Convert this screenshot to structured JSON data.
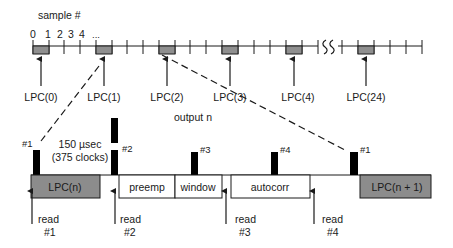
{
  "diagram": {
    "colors": {
      "line": "#1a1a1a",
      "gray_block": "#8c8c8c",
      "sample_block": "#8f8f8f",
      "bar": "#000000",
      "background": "#ffffff"
    },
    "sample_axis": {
      "label": "sample #",
      "tick_numbers": [
        "0",
        "1",
        "2",
        "3",
        "4",
        "..."
      ],
      "break_glyph": "SS"
    },
    "lpc_frames": [
      {
        "label": "LPC(0)"
      },
      {
        "label": "LPC(1)"
      },
      {
        "label": "LPC(2)"
      },
      {
        "label": "LPC(3)"
      },
      {
        "label": "LPC(4)"
      },
      {
        "label": "LPC(24)"
      }
    ],
    "timing": {
      "output_label": "output n",
      "duration_label": "150 µsec",
      "clocks_label": "(375 clocks)"
    },
    "markers": [
      "#1",
      "#2",
      "#3",
      "#4",
      "#1"
    ],
    "stages": [
      {
        "label": "LPC(n)",
        "shaded": true
      },
      {
        "label": "preemp",
        "shaded": false
      },
      {
        "label": "window",
        "shaded": false
      },
      {
        "label": "autocorr",
        "shaded": false
      },
      {
        "label": "LPC(n + 1)",
        "shaded": true
      }
    ],
    "reads": [
      {
        "line1": "read",
        "line2": "#1"
      },
      {
        "line1": "read",
        "line2": "#2"
      },
      {
        "line1": "read",
        "line2": "#3"
      },
      {
        "line1": "read",
        "line2": "#4"
      }
    ]
  }
}
